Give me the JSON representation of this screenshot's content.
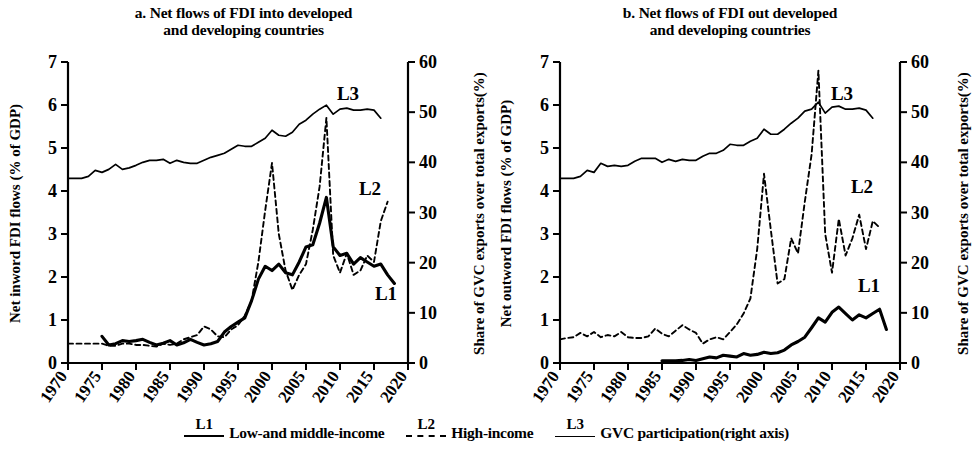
{
  "figure": {
    "panels": [
      {
        "id": "a",
        "title": "a. Net flows of FDI into developed\nand developing countries",
        "left_axis_label": "Net inword FDI flows (% of GDP)",
        "right_axis_label": "Share of GVC exports over total exports(%)",
        "series_labels": {
          "L1": "L1",
          "L2": "L2",
          "L3": "L3"
        }
      },
      {
        "id": "b",
        "title": "b. Net flows of FDI out developed\nand developing countries",
        "left_axis_label": "Net outword FDI flows (% of GDP)",
        "right_axis_label": "Share of GVC exports over total exports(%)",
        "series_labels": {
          "L1": "L1",
          "L2": "L2",
          "L3": "L3"
        }
      }
    ]
  },
  "legend": {
    "items": [
      {
        "code": "L1",
        "label": "Low-and middle-income",
        "style": "solid-thick"
      },
      {
        "code": "L2",
        "label": "High-income",
        "style": "dashed"
      },
      {
        "code": "L3",
        "label": "GVC participation(right axis)",
        "style": "solid-thin"
      }
    ]
  },
  "chart_data": [
    {
      "type": "line",
      "panel": "a",
      "title": "a. Net flows of FDI into developed and developing countries",
      "xlabel": "",
      "ylabel": "Net inword FDI flows (% of GDP)",
      "y2label": "Share of GVC exports over total exports(%)",
      "xlim": [
        1970,
        2020
      ],
      "ylim": [
        0,
        7
      ],
      "y2lim": [
        0,
        60
      ],
      "xticks": [
        1970,
        1975,
        1980,
        1985,
        1990,
        1995,
        2000,
        2005,
        2010,
        2015,
        2020
      ],
      "yticks": [
        0,
        1,
        2,
        3,
        4,
        5,
        6,
        7
      ],
      "y2ticks": [
        0,
        10,
        20,
        30,
        40,
        50,
        60
      ],
      "grid": false,
      "legend_position": "below-figure",
      "series": [
        {
          "name": "L1",
          "label": "Low-and middle-income",
          "axis": "left",
          "style": "solid-thick",
          "x": [
            1975,
            1976,
            1977,
            1978,
            1979,
            1980,
            1981,
            1982,
            1983,
            1984,
            1985,
            1986,
            1987,
            1988,
            1989,
            1990,
            1991,
            1992,
            1993,
            1994,
            1995,
            1996,
            1997,
            1998,
            1999,
            2000,
            2001,
            2002,
            2003,
            2004,
            2005,
            2006,
            2007,
            2008,
            2009,
            2010,
            2011,
            2012,
            2013,
            2014,
            2015,
            2016,
            2017,
            2018
          ],
          "y": [
            0.62,
            0.42,
            0.45,
            0.52,
            0.5,
            0.52,
            0.55,
            0.48,
            0.42,
            0.46,
            0.52,
            0.42,
            0.47,
            0.55,
            0.48,
            0.42,
            0.45,
            0.5,
            0.72,
            0.85,
            0.95,
            1.05,
            1.45,
            1.95,
            2.25,
            2.15,
            2.3,
            2.1,
            2.05,
            2.35,
            2.7,
            2.75,
            3.25,
            3.85,
            2.7,
            2.5,
            2.55,
            2.3,
            2.45,
            2.35,
            2.25,
            2.3,
            2.05,
            1.85
          ]
        },
        {
          "name": "L2",
          "label": "High-income",
          "axis": "left",
          "style": "dashed",
          "x": [
            1970,
            1971,
            1972,
            1973,
            1974,
            1975,
            1976,
            1977,
            1978,
            1979,
            1980,
            1981,
            1982,
            1983,
            1984,
            1985,
            1986,
            1987,
            1988,
            1989,
            1990,
            1991,
            1992,
            1993,
            1994,
            1995,
            1996,
            1997,
            1998,
            1999,
            2000,
            2001,
            2002,
            2003,
            2004,
            2005,
            2006,
            2007,
            2008,
            2009,
            2010,
            2011,
            2012,
            2013,
            2014,
            2015,
            2016,
            2017
          ],
          "y": [
            0.45,
            0.45,
            0.45,
            0.45,
            0.45,
            0.45,
            0.4,
            0.4,
            0.45,
            0.45,
            0.42,
            0.42,
            0.4,
            0.38,
            0.45,
            0.42,
            0.45,
            0.55,
            0.6,
            0.65,
            0.85,
            0.78,
            0.62,
            0.6,
            0.78,
            0.88,
            1.1,
            1.45,
            2.35,
            3.55,
            4.65,
            3.0,
            2.15,
            1.7,
            2.05,
            2.3,
            3.1,
            4.1,
            5.7,
            2.5,
            2.1,
            2.55,
            2.05,
            2.15,
            2.5,
            2.35,
            3.3,
            3.75
          ]
        },
        {
          "name": "L3",
          "label": "GVC participation(right axis)",
          "axis": "right",
          "style": "solid-thin",
          "x": [
            1970,
            1971,
            1972,
            1973,
            1974,
            1975,
            1976,
            1977,
            1978,
            1979,
            1980,
            1981,
            1982,
            1983,
            1984,
            1985,
            1986,
            1987,
            1988,
            1989,
            1990,
            1991,
            1992,
            1993,
            1994,
            1995,
            1996,
            1997,
            1998,
            1999,
            2000,
            2001,
            2002,
            2003,
            2004,
            2005,
            2006,
            2007,
            2008,
            2009,
            2010,
            2011,
            2012,
            2013,
            2014,
            2015,
            2016
          ],
          "y": [
            36.8,
            36.8,
            36.8,
            37.2,
            38.4,
            38.0,
            38.6,
            39.6,
            38.6,
            38.9,
            39.4,
            40.0,
            40.4,
            40.4,
            40.6,
            39.8,
            40.4,
            40.0,
            39.8,
            39.8,
            40.4,
            41.0,
            41.4,
            41.8,
            42.6,
            43.4,
            43.2,
            43.2,
            44.0,
            44.8,
            46.4,
            45.4,
            45.2,
            46.0,
            47.6,
            48.4,
            49.6,
            50.6,
            51.4,
            49.6,
            50.6,
            50.8,
            50.4,
            50.4,
            50.6,
            50.4,
            48.8
          ]
        }
      ]
    },
    {
      "type": "line",
      "panel": "b",
      "title": "b. Net flows of FDI out developed and developing countries",
      "xlabel": "",
      "ylabel": "Net outword FDI flows (% of GDP)",
      "y2label": "Share of GVC exports over total exports(%)",
      "xlim": [
        1970,
        2020
      ],
      "ylim": [
        0,
        7
      ],
      "y2lim": [
        0,
        60
      ],
      "xticks": [
        1970,
        1975,
        1980,
        1985,
        1990,
        1995,
        2000,
        2005,
        2010,
        2015,
        2020
      ],
      "yticks": [
        0,
        1,
        2,
        3,
        4,
        5,
        6,
        7
      ],
      "y2ticks": [
        0,
        10,
        20,
        30,
        40,
        50,
        60
      ],
      "grid": false,
      "legend_position": "below-figure",
      "series": [
        {
          "name": "L1",
          "label": "Low-and middle-income",
          "axis": "left",
          "style": "solid-thick",
          "x": [
            1985,
            1986,
            1987,
            1988,
            1989,
            1990,
            1991,
            1992,
            1993,
            1994,
            1995,
            1996,
            1997,
            1998,
            1999,
            2000,
            2001,
            2002,
            2003,
            2004,
            2005,
            2006,
            2007,
            2008,
            2009,
            2010,
            2011,
            2012,
            2013,
            2014,
            2015,
            2016,
            2017,
            2018
          ],
          "y": [
            0.05,
            0.05,
            0.05,
            0.06,
            0.08,
            0.06,
            0.1,
            0.14,
            0.12,
            0.18,
            0.16,
            0.14,
            0.22,
            0.18,
            0.2,
            0.25,
            0.22,
            0.24,
            0.3,
            0.42,
            0.5,
            0.6,
            0.82,
            1.05,
            0.95,
            1.18,
            1.3,
            1.15,
            1.0,
            1.12,
            1.05,
            1.15,
            1.25,
            0.78
          ]
        },
        {
          "name": "L2",
          "label": "High-income",
          "axis": "left",
          "style": "dashed",
          "x": [
            1970,
            1971,
            1972,
            1973,
            1974,
            1975,
            1976,
            1977,
            1978,
            1979,
            1980,
            1981,
            1982,
            1983,
            1984,
            1985,
            1986,
            1987,
            1988,
            1989,
            1990,
            1991,
            1992,
            1993,
            1994,
            1995,
            1996,
            1997,
            1998,
            1999,
            2000,
            2001,
            2002,
            2003,
            2004,
            2005,
            2006,
            2007,
            2008,
            2009,
            2010,
            2011,
            2012,
            2013,
            2014,
            2015,
            2016,
            2017
          ],
          "y": [
            0.55,
            0.58,
            0.6,
            0.7,
            0.62,
            0.72,
            0.6,
            0.65,
            0.62,
            0.72,
            0.6,
            0.58,
            0.58,
            0.62,
            0.8,
            0.68,
            0.62,
            0.75,
            0.88,
            0.78,
            0.7,
            0.45,
            0.55,
            0.6,
            0.55,
            0.72,
            0.9,
            1.15,
            1.5,
            2.65,
            4.4,
            3.1,
            1.85,
            1.95,
            2.9,
            2.55,
            3.75,
            4.85,
            6.8,
            3.0,
            2.1,
            3.35,
            2.5,
            2.9,
            3.45,
            2.65,
            3.3,
            3.15
          ]
        },
        {
          "name": "L3",
          "label": "GVC participation(right axis)",
          "axis": "right",
          "style": "solid-thin",
          "x": [
            1970,
            1971,
            1972,
            1973,
            1974,
            1975,
            1976,
            1977,
            1978,
            1979,
            1980,
            1981,
            1982,
            1983,
            1984,
            1985,
            1986,
            1987,
            1988,
            1989,
            1990,
            1991,
            1992,
            1993,
            1994,
            1995,
            1996,
            1997,
            1998,
            1999,
            2000,
            2001,
            2002,
            2003,
            2004,
            2005,
            2006,
            2007,
            2008,
            2009,
            2010,
            2011,
            2012,
            2013,
            2014,
            2015,
            2016
          ],
          "y": [
            36.8,
            36.8,
            36.8,
            37.2,
            38.4,
            38.0,
            39.8,
            39.2,
            39.4,
            39.2,
            39.4,
            40.2,
            40.8,
            40.8,
            40.8,
            40.0,
            40.6,
            40.2,
            40.6,
            40.4,
            40.4,
            41.2,
            41.8,
            41.8,
            42.4,
            43.6,
            43.4,
            43.4,
            44.2,
            44.8,
            46.6,
            45.6,
            45.6,
            46.6,
            47.8,
            48.8,
            50.2,
            50.6,
            52.0,
            49.8,
            51.0,
            51.2,
            50.6,
            50.6,
            50.8,
            50.4,
            48.8
          ]
        }
      ]
    }
  ]
}
